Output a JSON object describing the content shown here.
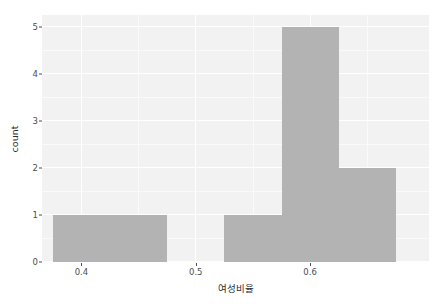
{
  "chart_data": {
    "type": "bar",
    "title": "",
    "subtitle": "",
    "xlabel": "여성비율",
    "ylabel": "count",
    "xlim": [
      0.3655,
      0.704
    ],
    "ylim": [
      0,
      5.25
    ],
    "x_ticks": [
      0.4,
      0.5,
      0.6
    ],
    "x_tick_labels": [
      "0.4",
      "0.5",
      "0.6"
    ],
    "y_ticks": [
      0,
      1,
      2,
      3,
      4,
      5
    ],
    "y_tick_labels": [
      "0",
      "1",
      "2",
      "3",
      "4",
      "5"
    ],
    "y_minor_ticks": [
      0.5,
      1.5,
      2.5,
      3.5,
      4.5
    ],
    "x_minor_ticks": [
      0.35,
      0.45,
      0.55,
      0.65
    ],
    "binwidth": 0.05,
    "categories": [
      "0.375-0.425",
      "0.425-0.475",
      "0.475-0.525",
      "0.525-0.575",
      "0.575-0.625",
      "0.625-0.675"
    ],
    "bin_starts": [
      0.375,
      0.425,
      0.475,
      0.525,
      0.575,
      0.625
    ],
    "bin_ends": [
      0.425,
      0.475,
      0.525,
      0.575,
      0.625,
      0.675
    ],
    "values": [
      1,
      1,
      0,
      1,
      5,
      2
    ],
    "grid": true,
    "legend": "none",
    "bar_color": "#b3b3b3",
    "panel_background": "#f2f2f2",
    "grid_color": "#ffffff",
    "plot_background": "#ffffff",
    "axis_text_color": "#4d4d4d",
    "axis_title_color": "#2b2b2b"
  }
}
